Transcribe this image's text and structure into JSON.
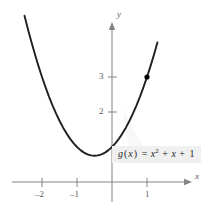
{
  "chart_data": {
    "type": "line",
    "title": "",
    "xlabel": "x",
    "ylabel": "y",
    "function_label": "g(x) = x^2 + x + 1",
    "function_parts": {
      "name": "g",
      "arg": "x",
      "equals": "=",
      "term1_base": "x",
      "term1_exp": "2",
      "plus1": "+",
      "term2": "x",
      "plus2": "+",
      "term3": "1"
    },
    "xlim": [
      -2.6,
      1.45
    ],
    "ylim": [
      -0.45,
      4.05
    ],
    "grid": false,
    "legend": false,
    "x_ticks": [
      -2,
      -1,
      1
    ],
    "x_tick_labels": [
      "–2",
      "–1",
      "1"
    ],
    "y_ticks": [
      2,
      3
    ],
    "y_tick_labels": [
      "2",
      "3"
    ],
    "series": [
      {
        "name": "g(x) = x^2 + x + 1",
        "x": [
          -2.5,
          -2.4,
          -2.3,
          -2.2,
          -2.1,
          -2.0,
          -1.9,
          -1.8,
          -1.7,
          -1.6,
          -1.5,
          -1.4,
          -1.3,
          -1.2,
          -1.1,
          -1.0,
          -0.9,
          -0.8,
          -0.7,
          -0.6,
          -0.5,
          -0.4,
          -0.3,
          -0.2,
          -0.1,
          0.0,
          0.1,
          0.2,
          0.3,
          0.4,
          0.5,
          0.6,
          0.7,
          0.8,
          0.9,
          1.0,
          1.1,
          1.2,
          1.3
        ],
        "y": [
          4.75,
          4.36,
          3.99,
          3.64,
          3.31,
          3.0,
          2.71,
          2.44,
          2.19,
          1.96,
          1.75,
          1.56,
          1.39,
          1.24,
          1.11,
          1.0,
          0.91,
          0.84,
          0.79,
          0.76,
          0.75,
          0.76,
          0.79,
          0.84,
          0.91,
          1.0,
          1.11,
          1.24,
          1.39,
          1.56,
          1.75,
          1.96,
          2.19,
          2.44,
          2.71,
          3.0,
          3.31,
          3.64,
          3.99
        ]
      }
    ],
    "points": [
      {
        "label": "marked-point",
        "x": 1,
        "y": 3
      }
    ],
    "vertex": {
      "x": -0.5,
      "y": 0.75
    },
    "colors": {
      "curve": "#231f20",
      "axis": "#808285",
      "tick_text": "#58595b",
      "point": "#000000",
      "label_background": "#f0f0f0",
      "label_text": "#231f20",
      "page_background": "#ffffff"
    }
  }
}
